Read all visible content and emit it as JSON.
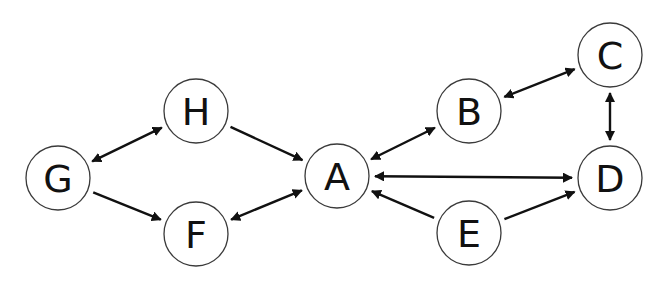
{
  "diagram": {
    "type": "directed-graph",
    "colors": {
      "node_stroke": "#3a3a3a",
      "node_fill": "#ffffff",
      "edge": "#111111",
      "text": "#111111",
      "background": "#ffffff"
    },
    "node_radius": 32,
    "nodes": [
      {
        "id": "A",
        "label": "A",
        "x": 337,
        "y": 176
      },
      {
        "id": "B",
        "label": "B",
        "x": 469,
        "y": 111
      },
      {
        "id": "C",
        "label": "C",
        "x": 610,
        "y": 55
      },
      {
        "id": "D",
        "label": "D",
        "x": 610,
        "y": 178
      },
      {
        "id": "E",
        "label": "E",
        "x": 469,
        "y": 233
      },
      {
        "id": "F",
        "label": "F",
        "x": 196,
        "y": 234
      },
      {
        "id": "G",
        "label": "G",
        "x": 58,
        "y": 178
      },
      {
        "id": "H",
        "label": "H",
        "x": 196,
        "y": 111
      }
    ],
    "edges": [
      {
        "from": "G",
        "to": "H",
        "bidirectional": true
      },
      {
        "from": "G",
        "to": "F",
        "bidirectional": false
      },
      {
        "from": "H",
        "to": "A",
        "bidirectional": false
      },
      {
        "from": "F",
        "to": "A",
        "bidirectional": true
      },
      {
        "from": "A",
        "to": "B",
        "bidirectional": true
      },
      {
        "from": "A",
        "to": "D",
        "bidirectional": true
      },
      {
        "from": "E",
        "to": "A",
        "bidirectional": false
      },
      {
        "from": "E",
        "to": "D",
        "bidirectional": false
      },
      {
        "from": "B",
        "to": "C",
        "bidirectional": true
      },
      {
        "from": "C",
        "to": "D",
        "bidirectional": true
      }
    ]
  }
}
